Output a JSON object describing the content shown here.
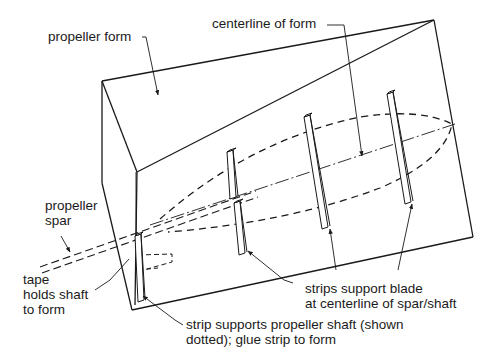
{
  "figure": {
    "type": "technical-illustration"
  },
  "labels": {
    "propeller_form": "propeller form",
    "centerline": "centerline of form",
    "propeller_spar": [
      "propeller",
      "spar"
    ],
    "tape": [
      "tape",
      "holds shaft",
      "to form"
    ],
    "strips_support": [
      "strips support blade",
      "at centerline of spar/shaft"
    ],
    "strip_supports_shaft": [
      "strip supports propeller shaft (shown",
      "dotted); glue strip to form"
    ]
  },
  "colors": {
    "line": "#1a1a1a",
    "background": "#ffffff"
  }
}
